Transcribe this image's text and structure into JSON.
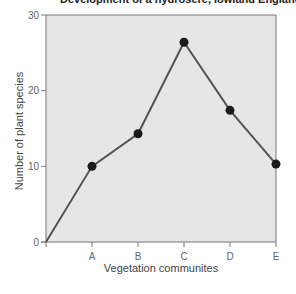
{
  "chart_data": {
    "type": "line",
    "title": "Development of a hydrosere, lowland England",
    "xlabel": "Vegetation communites",
    "ylabel": "Number of plant species",
    "categories": [
      "",
      "A",
      "B",
      "C",
      "D",
      "E"
    ],
    "x_ticks": [
      "A",
      "B",
      "C",
      "D",
      "E"
    ],
    "y_ticks": [
      0,
      10,
      20,
      30
    ],
    "ylim": [
      0,
      30
    ],
    "grid": false,
    "legend": null,
    "series": [
      {
        "name": "Number of plant species",
        "values": [
          0,
          10,
          14.3,
          26.4,
          17.4,
          10.3
        ]
      }
    ],
    "colors": {
      "line": "#555555",
      "marker": "#1a1a1a",
      "plot_bg": "#e6e6e6",
      "axis": "#777777"
    }
  }
}
